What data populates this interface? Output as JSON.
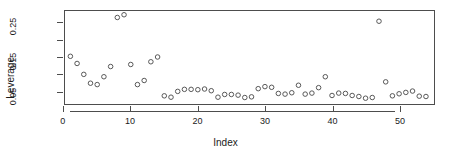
{
  "chart_data": {
    "type": "scatter",
    "title": "",
    "subtitle": "",
    "xlabel": "Index",
    "ylabel": "Leverage",
    "xlim": [
      0.2,
      55.2
    ],
    "ylim": [
      0.012,
      0.285
    ],
    "grid": false,
    "legend": null,
    "point_marker": "open-circle",
    "point_color": "#555555",
    "xticks": [
      0,
      10,
      20,
      30,
      40,
      50
    ],
    "xtick_labels": [
      "0",
      "10",
      "20",
      "30",
      "40",
      "50"
    ],
    "yticks": [
      0.05,
      0.15,
      0.25
    ],
    "ytick_labels": [
      "0.05",
      "0.15",
      "0.25"
    ],
    "yticks_minor": [
      0.1,
      0.2
    ],
    "x": [
      1,
      2,
      3,
      4,
      5,
      6,
      7,
      8,
      9,
      10,
      11,
      12,
      13,
      14,
      15,
      16,
      17,
      18,
      19,
      20,
      21,
      22,
      23,
      24,
      25,
      26,
      27,
      28,
      29,
      30,
      31,
      32,
      33,
      34,
      35,
      36,
      37,
      38,
      39,
      40,
      41,
      42,
      43,
      44,
      45,
      46,
      47,
      48,
      49,
      50,
      51,
      52,
      53,
      54
    ],
    "y": [
      0.152,
      0.131,
      0.099,
      0.073,
      0.069,
      0.092,
      0.122,
      0.266,
      0.274,
      0.128,
      0.069,
      0.081,
      0.136,
      0.15,
      0.036,
      0.032,
      0.049,
      0.055,
      0.055,
      0.054,
      0.056,
      0.051,
      0.032,
      0.04,
      0.04,
      0.038,
      0.031,
      0.033,
      0.057,
      0.063,
      0.061,
      0.043,
      0.041,
      0.045,
      0.067,
      0.041,
      0.044,
      0.06,
      0.092,
      0.037,
      0.044,
      0.043,
      0.037,
      0.034,
      0.029,
      0.031,
      0.255,
      0.077,
      0.036,
      0.042,
      0.046,
      0.05,
      0.035,
      0.034
    ]
  },
  "figure": {
    "width": 451,
    "height": 162,
    "background": "#ffffff",
    "axis_color": "#4d4d4d",
    "text_color": "#1a1a1a"
  }
}
